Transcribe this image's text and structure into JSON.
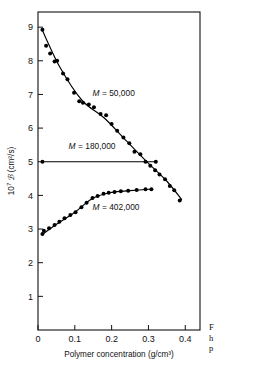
{
  "figure": {
    "kind": "scientific-plot",
    "background_color": "#ffffff",
    "ink_color": "#000000"
  },
  "caption": {
    "line1": "F",
    "line2": "h",
    "line3": "p",
    "note": "caption text clipped at right page edge"
  },
  "chart_data": {
    "type": "line",
    "title": "",
    "xlabel": "Polymer concentration (g/cm³)",
    "ylabel": "10⁷ ℬ (cm²/s)",
    "ylabel_parts": {
      "mantissa": "10",
      "exponent": "7",
      "symbol": "ℬ",
      "units": "(cm²/s)"
    },
    "xlim": [
      0,
      0.44
    ],
    "ylim": [
      0,
      9.45
    ],
    "grid": false,
    "legend_position": "inline-annotations",
    "xticks": [
      0,
      0.1,
      0.2,
      0.3,
      0.4
    ],
    "xticklabels": [
      "0",
      "0.1",
      "0.2",
      "0.3",
      "0.4"
    ],
    "yticks": [
      1,
      2,
      3,
      4,
      5,
      6,
      7,
      8,
      9
    ],
    "yticklabels": [
      "1",
      "2",
      "3",
      "4",
      "5",
      "6",
      "7",
      "8",
      "9"
    ],
    "series": [
      {
        "name": "M = 50,000",
        "label_prefix": "M",
        "label_value": "= 50,000",
        "annotation_x": 0.148,
        "annotation_y": 6.95,
        "marker": "filled-circle",
        "x": [
          0.012,
          0.022,
          0.033,
          0.045,
          0.052,
          0.068,
          0.08,
          0.098,
          0.112,
          0.122,
          0.138,
          0.152,
          0.17,
          0.185,
          0.2,
          0.215,
          0.232,
          0.248,
          0.262,
          0.278,
          0.292,
          0.305,
          0.318,
          0.33,
          0.345,
          0.358,
          0.37,
          0.385
        ],
        "y": [
          8.92,
          8.45,
          8.22,
          7.98,
          8.0,
          7.62,
          7.45,
          7.05,
          6.8,
          6.75,
          6.7,
          6.62,
          6.42,
          6.38,
          6.12,
          5.92,
          5.72,
          5.55,
          5.3,
          5.22,
          5.0,
          4.88,
          4.75,
          4.62,
          4.48,
          4.28,
          4.15,
          3.85
        ],
        "fit_x": [
          0.01,
          0.06,
          0.12,
          0.18,
          0.24,
          0.3,
          0.35,
          0.39
        ],
        "fit_y": [
          8.95,
          7.8,
          6.82,
          6.3,
          5.62,
          4.95,
          4.42,
          3.88
        ]
      },
      {
        "name": "M = 180,000",
        "label_prefix": "M",
        "label_value": "= 180,000",
        "annotation_x": 0.083,
        "annotation_y": 5.38,
        "marker": "filled-circle",
        "x": [
          0.012,
          0.32
        ],
        "y": [
          5.0,
          5.0
        ],
        "fit_x": [
          0.012,
          0.32
        ],
        "fit_y": [
          5.0,
          5.0
        ]
      },
      {
        "name": "M = 402,000",
        "label_prefix": "M",
        "label_value": "= 402,000",
        "annotation_x": 0.148,
        "annotation_y": 3.58,
        "marker": "filled-circle",
        "x": [
          0.012,
          0.016,
          0.03,
          0.045,
          0.058,
          0.072,
          0.088,
          0.102,
          0.118,
          0.132,
          0.148,
          0.162,
          0.178,
          0.192,
          0.208,
          0.225,
          0.245,
          0.268,
          0.292,
          0.308
        ],
        "y": [
          2.85,
          2.95,
          3.02,
          3.12,
          3.22,
          3.32,
          3.42,
          3.5,
          3.65,
          3.78,
          3.92,
          3.98,
          4.05,
          4.08,
          4.1,
          4.12,
          4.14,
          4.16,
          4.18,
          4.18
        ],
        "fit_x": [
          0.012,
          0.05,
          0.1,
          0.15,
          0.2,
          0.25,
          0.31
        ],
        "fit_y": [
          2.84,
          3.14,
          3.5,
          3.92,
          4.09,
          4.14,
          4.19
        ]
      }
    ]
  }
}
